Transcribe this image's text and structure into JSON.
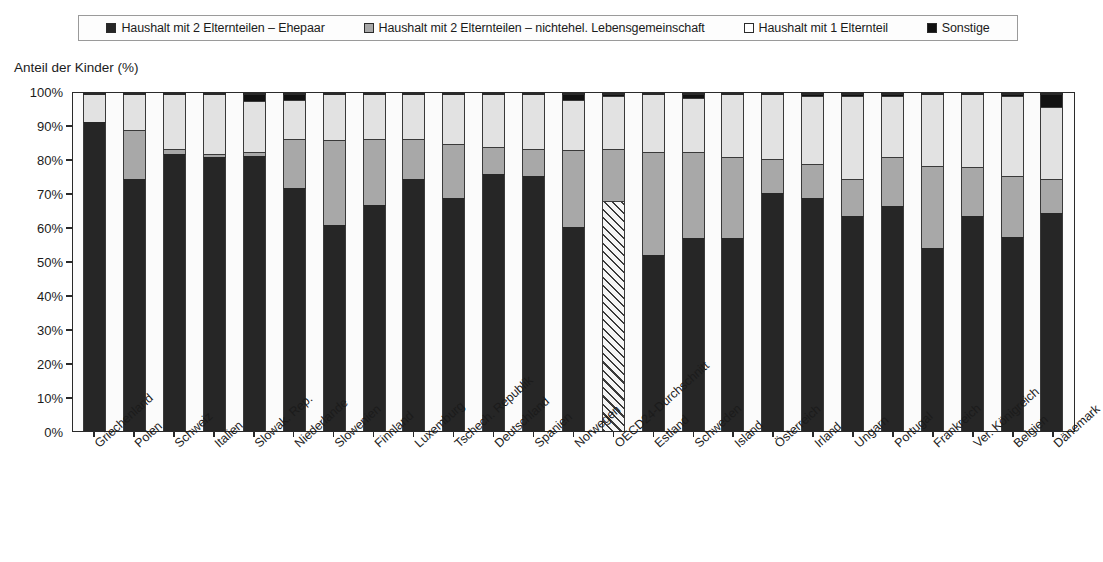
{
  "axis_title": "Anteil der Kinder (%)",
  "legend": {
    "items": [
      {
        "label": "Haushalt mit 2 Elternteilen – Ehepaar",
        "swatch": "filled-black-square-icon",
        "color": "#262626"
      },
      {
        "label": "Haushalt mit 2 Elternteilen – nichtehel. Lebensgemeinschaft",
        "swatch": "filled-gray-square-icon",
        "color": "#a8a8a8"
      },
      {
        "label": "Haushalt mit 1 Elternteil",
        "swatch": "empty-square-icon",
        "color": "#ffffff"
      },
      {
        "label": "Sonstige",
        "swatch": "filled-dark-square-icon",
        "color": "#111111"
      }
    ]
  },
  "y_axis": {
    "ticks": [
      "100%",
      "90%",
      "80%",
      "70%",
      "60%",
      "50%",
      "40%",
      "30%",
      "20%",
      "10%",
      "0%"
    ],
    "min": 0,
    "max": 100
  },
  "chart_data": {
    "type": "bar",
    "subtype": "stacked-bar-100-percent",
    "title": "",
    "subtitle": "",
    "xlabel": "",
    "ylabel": "Anteil der Kinder (%)",
    "ylim": [
      0,
      100
    ],
    "grid": false,
    "legend_position": "top",
    "categories": [
      "Griechenland",
      "Polen",
      "Schweiz",
      "Italien",
      "Slowak. Rep.",
      "Niederlande",
      "Slowenien",
      "Finnland",
      "Luxemburg",
      "Tschech. Republik",
      "Deutschland",
      "Spanien",
      "Norwegen",
      "OECD24-Durchschnitt",
      "Estland",
      "Schweden",
      "Island",
      "Österreich",
      "Irland",
      "Ungarn",
      "Portugal",
      "Frankreich",
      "Ver. Königreich",
      "Belgien",
      "Dänemark"
    ],
    "series": [
      {
        "name": "Haushalt mit 2 Elternteilen – Ehepaar",
        "color": "#262626",
        "values": [
          91.5,
          74.5,
          82.0,
          81.0,
          81.5,
          72.0,
          61.0,
          67.0,
          74.5,
          69.0,
          76.0,
          75.5,
          60.5,
          68.0,
          52.0,
          57.0,
          57.0,
          70.5,
          69.0,
          63.5,
          66.5,
          54.0,
          63.5,
          57.5,
          64.5
        ]
      },
      {
        "name": "Haushalt mit 2 Elternteilen – nichtehel. Lebensgemeinschaft",
        "color": "#a8a8a8",
        "values": [
          0.0,
          14.5,
          1.5,
          1.0,
          1.0,
          14.5,
          25.0,
          19.5,
          12.0,
          16.0,
          8.0,
          8.0,
          22.5,
          15.5,
          30.5,
          25.5,
          24.0,
          10.0,
          10.0,
          11.0,
          14.5,
          24.5,
          14.5,
          18.0,
          10.0
        ]
      },
      {
        "name": "Haushalt mit 1 Elternteil",
        "color": "#e2e2e2",
        "values": [
          8.5,
          11.0,
          16.5,
          18.0,
          15.0,
          11.5,
          14.0,
          13.5,
          13.5,
          15.0,
          16.0,
          16.5,
          15.0,
          15.5,
          17.5,
          16.0,
          19.0,
          19.5,
          20.0,
          24.5,
          18.0,
          21.5,
          22.0,
          23.5,
          21.5
        ]
      },
      {
        "name": "Sonstige",
        "color": "#121212",
        "values": [
          0.0,
          0.0,
          0.0,
          0.0,
          2.5,
          2.0,
          0.0,
          0.0,
          0.0,
          0.0,
          0.0,
          0.0,
          2.0,
          1.0,
          0.0,
          1.5,
          0.0,
          0.0,
          1.0,
          1.0,
          1.0,
          0.0,
          0.0,
          1.0,
          4.0
        ]
      }
    ]
  }
}
